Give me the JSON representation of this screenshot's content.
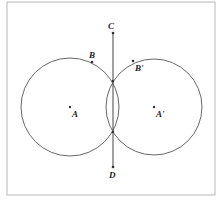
{
  "diagram": {
    "frame": {
      "x": 7,
      "y": 2,
      "width": 208,
      "height": 193,
      "stroke": "#b8b8b8"
    },
    "stroke_color": "#555555",
    "circles": [
      {
        "name": "circle-A",
        "center": "A",
        "cx": 70,
        "cy": 107,
        "r": 49
      },
      {
        "name": "circle-A-prime",
        "center": "A'",
        "cx": 154,
        "cy": 107,
        "r": 48
      }
    ],
    "segments": [
      {
        "name": "segment-CD",
        "from": "C",
        "to": "D",
        "x1": 113,
        "y1": 33,
        "x2": 113,
        "y2": 167
      }
    ],
    "points": [
      {
        "id": "C",
        "label": "C",
        "x": 113,
        "y": 33,
        "lx": 108,
        "ly": 29
      },
      {
        "id": "D",
        "label": "D",
        "x": 113,
        "y": 167,
        "lx": 109,
        "ly": 178
      },
      {
        "id": "B",
        "label": "B",
        "x": 92,
        "y": 62,
        "lx": 89,
        "ly": 58
      },
      {
        "id": "B-prime",
        "label": "B'",
        "x": 133,
        "y": 61,
        "lx": 135,
        "ly": 71
      },
      {
        "id": "A",
        "label": "A",
        "x": 70,
        "y": 107,
        "lx": 72,
        "ly": 117
      },
      {
        "id": "A-prime",
        "label": "A'",
        "x": 154,
        "y": 107,
        "lx": 156,
        "ly": 117
      },
      {
        "id": "P-upper",
        "label": "",
        "x": 113,
        "y": 81
      },
      {
        "id": "P-lower",
        "label": "",
        "x": 113,
        "y": 132
      }
    ],
    "labels": {
      "C": "C",
      "D": "D",
      "B": "B",
      "B_prime": "B'",
      "A": "A",
      "A_prime": "A'"
    }
  }
}
